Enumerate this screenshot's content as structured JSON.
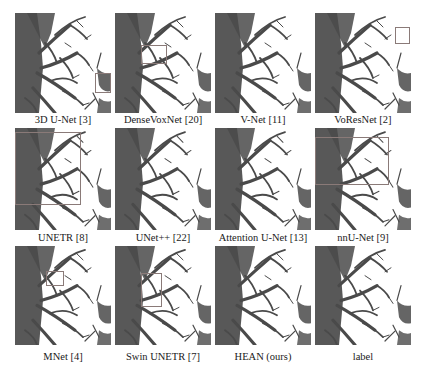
{
  "figure": {
    "rows": [
      {
        "panels": [
          {
            "label": "3D U-Net [3]",
            "box": {
              "x": 95,
              "y": 73,
              "w": 16,
              "h": 20
            }
          },
          {
            "label": "DenseVoxNet [20]",
            "box": {
              "x": 141,
              "y": 45,
              "w": 26,
              "h": 19
            }
          },
          {
            "label": "V-Net [11]",
            "box": null
          },
          {
            "label": "VoResNet [2]",
            "box": {
              "x": 395,
              "y": 27,
              "w": 15,
              "h": 17
            }
          }
        ]
      },
      {
        "panels": [
          {
            "label": "UNETR [8]",
            "box": {
              "x": 15,
              "y": 132,
              "w": 66,
              "h": 73
            }
          },
          {
            "label": "UNet++ [22]",
            "box": null
          },
          {
            "label": "Attention U-Net [13]",
            "box": null
          },
          {
            "label": "nnU-Net [9]",
            "box": {
              "x": 315,
              "y": 137,
              "w": 74,
              "h": 48
            }
          }
        ]
      },
      {
        "panels": [
          {
            "label": "MNet [4]",
            "box": {
              "x": 46,
              "y": 271,
              "w": 18,
              "h": 15
            }
          },
          {
            "label": "Swin UNETR [7]",
            "box": {
              "x": 141,
              "y": 273,
              "w": 21,
              "h": 34
            }
          },
          {
            "label": "HEAN (ours)",
            "box": null
          },
          {
            "label": "label",
            "box": null
          }
        ]
      }
    ],
    "colors": {
      "structure": "#4a4a4a",
      "box": "#8a7a78",
      "background": "#ffffff"
    }
  }
}
